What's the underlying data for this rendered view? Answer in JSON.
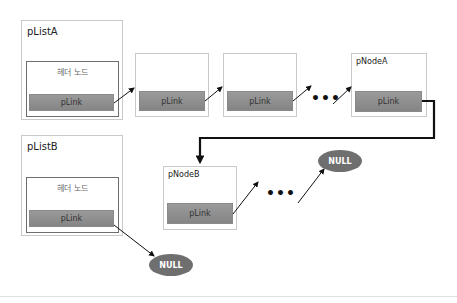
{
  "diagram": {
    "type": "linked-list-concatenation",
    "lists": [
      {
        "id": "pListA",
        "label": "pListA",
        "header": {
          "label": "헤더 노드",
          "link_label": "pLink"
        }
      },
      {
        "id": "pListB",
        "label": "pListB",
        "header": {
          "label": "헤더 노드",
          "link_label": "pLink"
        }
      }
    ],
    "nodes": {
      "a1": {
        "label": "",
        "link_label": "pLink"
      },
      "a2": {
        "label": "",
        "link_label": "pLink"
      },
      "pNodeA": {
        "label": "pNodeA",
        "link_label": "pLink"
      },
      "pNodeB": {
        "label": "pNodeB",
        "link_label": "pLink"
      }
    },
    "ellipsis": "•••",
    "null_a": "NULL",
    "null_b": "NULL",
    "edges": [
      {
        "from": "pListA.header",
        "to": "a1"
      },
      {
        "from": "a1",
        "to": "a2"
      },
      {
        "from": "a2",
        "to": "ellipsis"
      },
      {
        "from": "ellipsis",
        "to": "pNodeA"
      },
      {
        "from": "pNodeA",
        "to": "pNodeB",
        "style": "thick"
      },
      {
        "from": "pNodeB",
        "to": "ellipsis"
      },
      {
        "from": "ellipsis",
        "to": "NULL"
      },
      {
        "from": "pListB.header",
        "to": "NULL"
      }
    ],
    "colors": {
      "link_bar": "#8f8f8f",
      "null_fill": "#6f6f6f",
      "box_border": "#c9c9c9",
      "inner_border": "#6e6e6e"
    }
  }
}
